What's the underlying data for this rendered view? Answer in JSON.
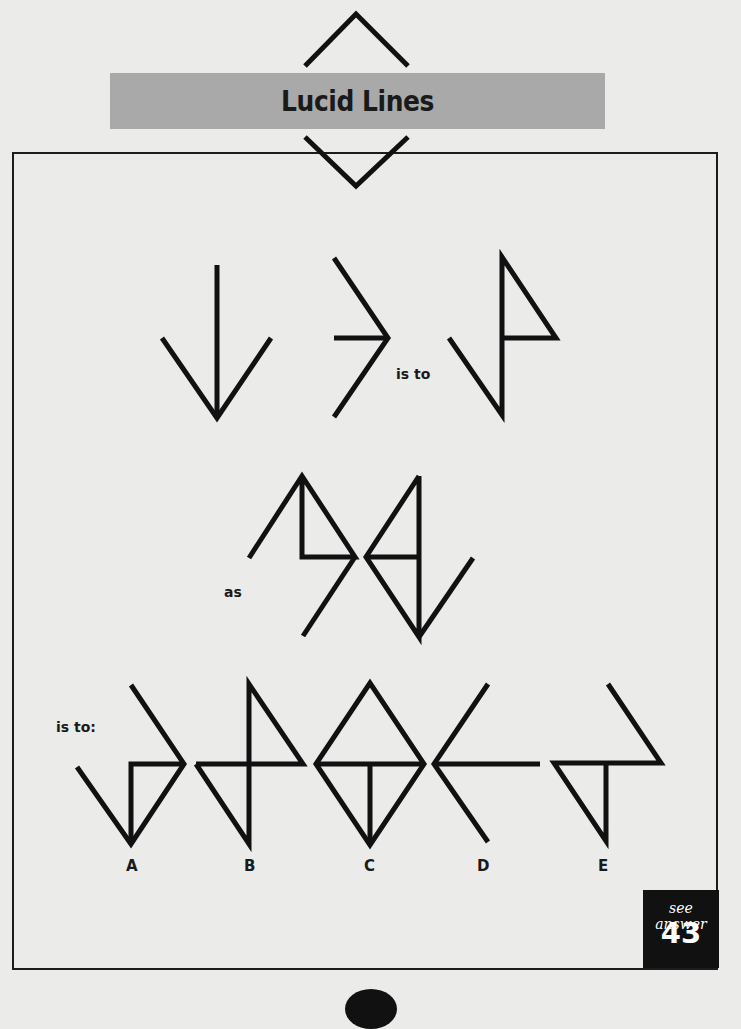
{
  "page": {
    "title": "Lucid Lines",
    "colors": {
      "background": "#ebebea",
      "title_bar": "#a9a9a9",
      "ink": "#111111"
    }
  },
  "puzzle": {
    "connectors": {
      "first": "is to",
      "second": "as",
      "third": "is to:"
    },
    "question_figures": [
      {
        "id": "fig1",
        "description": "downward arrow: vertical line meeting a V at bottom"
      },
      {
        "id": "fig2",
        "description": "right-pointing chevron with horizontal line to vertex"
      },
      {
        "id": "fig3",
        "description": "vertical line with triangle flag on upper right and diagonal to bottom-left"
      },
      {
        "id": "fig4",
        "description": "peak with right triangle and diagonal tail to lower left"
      },
      {
        "id": "fig5",
        "description": "triangle with vertical line and diagonal tail to upper right"
      }
    ],
    "options": [
      {
        "label": "A"
      },
      {
        "label": "B"
      },
      {
        "label": "C"
      },
      {
        "label": "D"
      },
      {
        "label": "E"
      }
    ]
  },
  "answer_ref": {
    "caption": "see answer",
    "number": "43"
  }
}
